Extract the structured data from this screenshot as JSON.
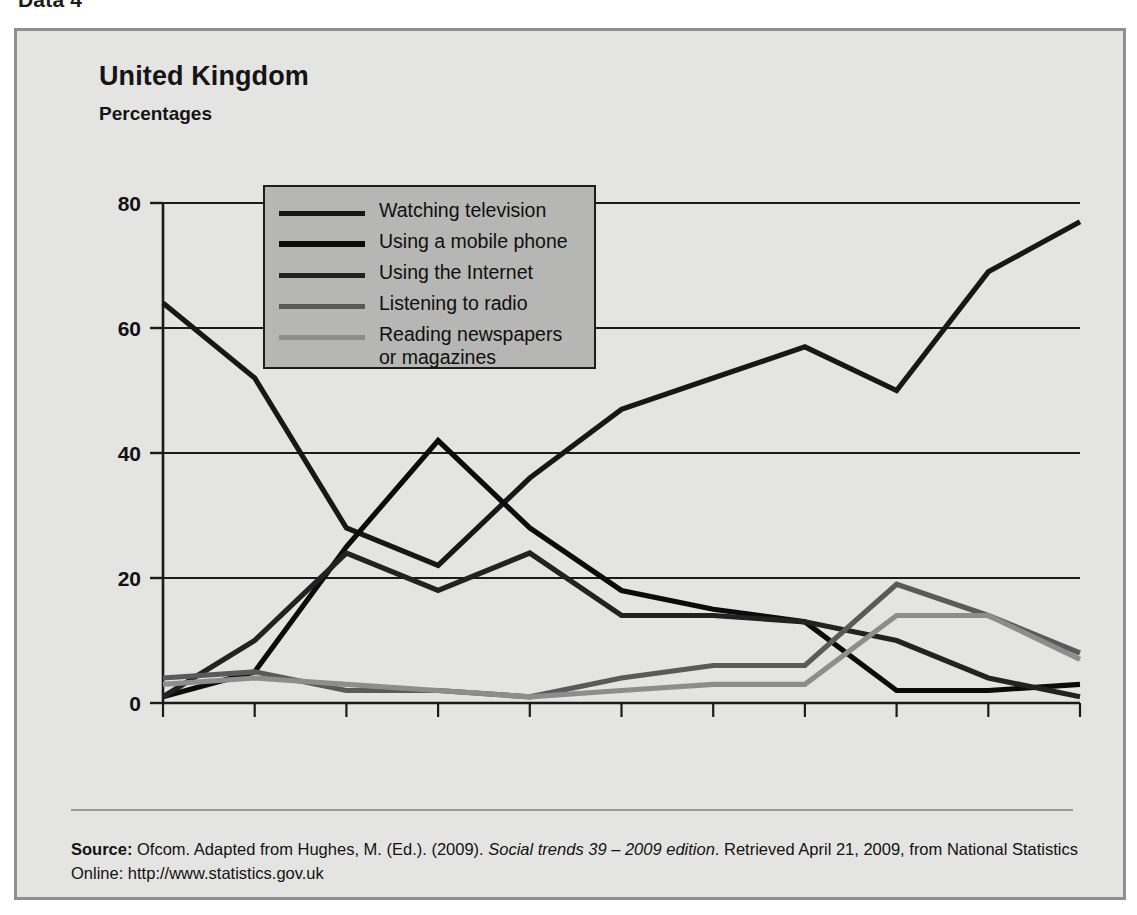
{
  "top_caption": "Data 4",
  "figure": {
    "title": "United Kingdom",
    "subtitle": "Percentages"
  },
  "source": {
    "label": "Source:",
    "line1_a": " Ofcom. Adapted from Hughes, M. (Ed.). (2009). ",
    "italic": "Social trends 39 – 2009 edition",
    "line1_b": ". Retrieved April 21, 2009, from National",
    "line2": "Statistics Online: http://www.statistics.gov.uk"
  },
  "legend": {
    "items": [
      {
        "label": "Watching television",
        "color": "#171717",
        "width": 5
      },
      {
        "label": "Using a mobile phone",
        "color": "#0b0b0b",
        "width": 6
      },
      {
        "label": "Using the Internet",
        "color": "#222222",
        "width": 5
      },
      {
        "label": "Listening to radio",
        "color": "#5a5a5a",
        "width": 5
      },
      {
        "label": "Reading newspapers\nor magazines",
        "color": "#8d8d8d",
        "width": 5
      }
    ]
  },
  "chart_data": {
    "type": "line",
    "title": "United Kingdom",
    "subtitle": "Percentages",
    "xlabel": "",
    "ylabel": "Percentages",
    "ylim": [
      0,
      80
    ],
    "yticks": [
      0,
      20,
      40,
      60,
      80
    ],
    "grid": "horizontal",
    "legend_position": "upper-left-inside",
    "categories": [
      "5–7",
      "8–11",
      "12–15",
      "16–19",
      "20–24",
      "25–34",
      "35–44",
      "45–54",
      "55–64",
      "65–74",
      "75"
    ],
    "last_category_suffix": "and over",
    "series": [
      {
        "name": "Watching television",
        "color": "#171717",
        "values": [
          64,
          52,
          28,
          22,
          36,
          47,
          52,
          57,
          50,
          69,
          77
        ]
      },
      {
        "name": "Using a mobile phone",
        "color": "#0b0b0b",
        "values": [
          1,
          5,
          25,
          42,
          28,
          18,
          15,
          13,
          2,
          2,
          3
        ]
      },
      {
        "name": "Using the Internet",
        "color": "#222222",
        "values": [
          1,
          10,
          24,
          18,
          24,
          14,
          14,
          13,
          10,
          4,
          1
        ]
      },
      {
        "name": "Listening to radio",
        "color": "#5a5a5a",
        "values": [
          4,
          5,
          2,
          2,
          1,
          4,
          6,
          6,
          19,
          14,
          8
        ]
      },
      {
        "name": "Reading newspapers or magazines",
        "color": "#8d8d8d",
        "values": [
          3,
          4,
          3,
          2,
          1,
          2,
          3,
          3,
          14,
          14,
          7
        ]
      }
    ]
  },
  "axis": {
    "y_tick_labels": [
      "80",
      "60",
      "40",
      "20",
      "0"
    ],
    "x_tick_labels": [
      "5–7",
      "8–11",
      "12–15",
      "16–19",
      "20–24",
      "25–34",
      "35–44",
      "45–54",
      "55–64",
      "65–74",
      "75"
    ],
    "x_last_suffix": "and over"
  }
}
